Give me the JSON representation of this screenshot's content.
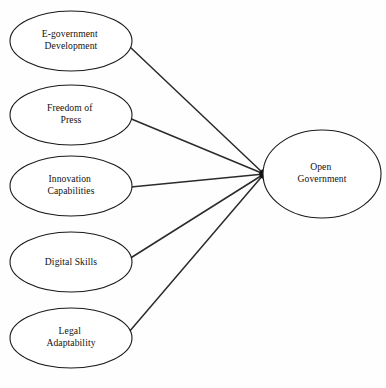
{
  "diagram": {
    "type": "conceptual-model",
    "background_color": "#fefefe",
    "stroke_color": "#1a1a1a",
    "edge_color": "#2b2b2b",
    "text_color": "#111111",
    "junction": {
      "name": "convergence-point",
      "x": 264,
      "y": 174
    },
    "predictors": [
      {
        "id": "e-government-development",
        "line1": "E-government",
        "line2": "Development",
        "cx": 71,
        "cy": 41,
        "rx": 61,
        "ry": 30,
        "anchor_x": 130,
        "anchor_y": 47
      },
      {
        "id": "freedom-of-press",
        "line1": "Freedom of",
        "line2": "Press",
        "cx": 71,
        "cy": 115,
        "rx": 61,
        "ry": 30,
        "anchor_x": 129,
        "anchor_y": 118
      },
      {
        "id": "innovation-capabilities",
        "line1": "Innovation",
        "line2": "Capabilities",
        "cx": 71,
        "cy": 186,
        "rx": 61,
        "ry": 30,
        "anchor_x": 131,
        "anchor_y": 187
      },
      {
        "id": "digital-skills",
        "line1": "Digital Skills",
        "line2": "",
        "cx": 71,
        "cy": 262,
        "rx": 61,
        "ry": 30,
        "anchor_x": 129,
        "anchor_y": 259
      },
      {
        "id": "legal-adaptability",
        "line1": "Legal",
        "line2": "Adaptability",
        "cx": 71,
        "cy": 338,
        "rx": 61,
        "ry": 30,
        "anchor_x": 129,
        "anchor_y": 332
      }
    ],
    "outcome": {
      "id": "open-government",
      "line1": "Open",
      "line2": "Government",
      "cx": 322,
      "cy": 174,
      "rx": 59,
      "ry": 44
    }
  }
}
